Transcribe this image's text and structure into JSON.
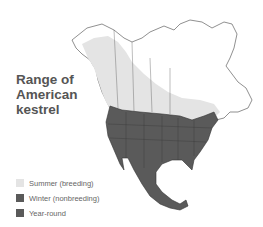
{
  "title": {
    "lines": [
      "Range of",
      "American",
      "kestrel"
    ]
  },
  "legend": {
    "items": [
      {
        "label": "Summer (breeding)",
        "color": "#e4e4e4"
      },
      {
        "label": "Winter (nonbreeding)",
        "color": "#5a5a5a"
      },
      {
        "label": "Year-round",
        "color": "#5a5a5a"
      }
    ]
  },
  "map": {
    "region": "North America",
    "summer_color": "#e4e4e4",
    "yearround_color": "#5a5a5a",
    "outline_color": "#333333"
  }
}
